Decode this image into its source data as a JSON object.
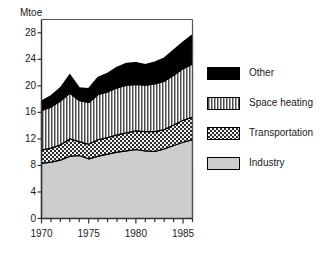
{
  "chart_data": {
    "type": "area",
    "title": "",
    "subtitle": "",
    "xlabel": "",
    "ylabel": "Mtoe",
    "stacked": true,
    "grid": false,
    "legend_position": "right",
    "xlim": [
      1970,
      1986
    ],
    "ylim": [
      0,
      30
    ],
    "ytick_labels": [
      "0",
      "4",
      "8",
      "12",
      "16",
      "20",
      "24",
      "28"
    ],
    "ytick_values": [
      0,
      4,
      8,
      12,
      16,
      20,
      24,
      28
    ],
    "xtick_labels": [
      "1970",
      "1975",
      "1980",
      "1985"
    ],
    "xtick_values": [
      1970,
      1975,
      1980,
      1985
    ],
    "x_minor_ticks": [
      1970,
      1971,
      1972,
      1973,
      1974,
      1975,
      1976,
      1977,
      1978,
      1979,
      1980,
      1981,
      1982,
      1983,
      1984,
      1985,
      1986
    ],
    "x": [
      1970,
      1971,
      1972,
      1973,
      1974,
      1975,
      1976,
      1977,
      1978,
      1979,
      1980,
      1981,
      1982,
      1983,
      1984,
      1985,
      1986
    ],
    "series": [
      {
        "name": "Industry",
        "pattern": "solid-light-gray",
        "color": "#cfcfcf",
        "values": [
          8.3,
          8.5,
          8.8,
          9.4,
          9.5,
          9.0,
          9.4,
          9.7,
          10.0,
          10.2,
          10.4,
          10.2,
          10.1,
          10.5,
          11.0,
          11.5,
          11.9
        ]
      },
      {
        "name": "Transportation",
        "pattern": "cross-hatch",
        "color": "#7a7a7a",
        "values": [
          2.0,
          2.1,
          2.3,
          2.6,
          2.1,
          2.2,
          2.5,
          2.5,
          2.6,
          2.7,
          2.8,
          2.9,
          3.0,
          2.9,
          3.1,
          3.3,
          3.4
        ]
      },
      {
        "name": "Space heating",
        "pattern": "vertical-lines",
        "color": "#b5b5b5",
        "values": [
          6.0,
          6.2,
          6.6,
          6.9,
          6.2,
          6.3,
          6.8,
          6.9,
          7.1,
          7.2,
          7.0,
          7.0,
          7.2,
          7.3,
          7.5,
          7.8,
          8.0
        ]
      },
      {
        "name": "Other",
        "pattern": "solid-black",
        "color": "#000000",
        "values": [
          1.4,
          1.7,
          2.0,
          2.8,
          1.9,
          2.1,
          2.6,
          2.8,
          3.1,
          3.3,
          3.3,
          3.1,
          3.3,
          3.5,
          3.8,
          4.0,
          4.4
        ]
      }
    ],
    "totals": [
      17.7,
      18.5,
      19.7,
      21.7,
      19.7,
      19.6,
      21.3,
      21.9,
      22.8,
      23.4,
      23.5,
      23.2,
      23.6,
      24.2,
      25.4,
      26.6,
      27.7
    ]
  },
  "legend": {
    "items": [
      {
        "label": "Other",
        "swatch": "solid-black"
      },
      {
        "label": "Space heating",
        "swatch": "vertical-lines"
      },
      {
        "label": "Transportation",
        "swatch": "cross-hatch"
      },
      {
        "label": "Industry",
        "swatch": "solid-light-gray"
      }
    ]
  }
}
